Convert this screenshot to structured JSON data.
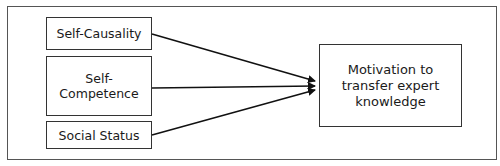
{
  "diagram": {
    "sources": [
      {
        "label": "Self-Causality"
      },
      {
        "label_line1": "Self-",
        "label_line2": "Competence"
      },
      {
        "label": "Social Status"
      }
    ],
    "target": {
      "line1": "Motivation to",
      "line2": "transfer expert",
      "line3": "knowledge"
    },
    "edges": [
      {
        "from": "Self-Causality",
        "to": "Motivation to transfer expert knowledge"
      },
      {
        "from": "Self-Competence",
        "to": "Motivation to transfer expert knowledge"
      },
      {
        "from": "Social Status",
        "to": "Motivation to transfer expert knowledge"
      }
    ]
  }
}
